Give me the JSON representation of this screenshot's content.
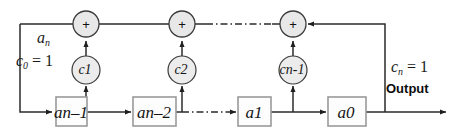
{
  "diagram": {
    "colors": {
      "line": "#2b2b2b",
      "node_fill": "#e8e8e8",
      "box_fill": "#fdfdfd",
      "box_stroke": "#9a9a9a",
      "text": "#151515",
      "background": "#ffffff"
    },
    "adders": [
      {
        "id": "adder-1",
        "symbol": "+",
        "cx": 86,
        "cy": 24
      },
      {
        "id": "adder-2",
        "symbol": "+",
        "cx": 182,
        "cy": 24
      },
      {
        "id": "adder-3",
        "symbol": "+",
        "cx": 293,
        "cy": 24
      }
    ],
    "coefficients": [
      {
        "id": "coef-c1",
        "base": "c",
        "sub": "1",
        "cx": 86,
        "cy": 70
      },
      {
        "id": "coef-c2",
        "base": "c",
        "sub": "2",
        "cx": 182,
        "cy": 70
      },
      {
        "id": "coef-cn1",
        "base": "c",
        "sub": "n-1",
        "cx": 293,
        "cy": 70
      }
    ],
    "delay_boxes": [
      {
        "id": "box-an1",
        "base": "a",
        "sub": "n–1",
        "cx": 62,
        "cy": 112
      },
      {
        "id": "box-an2",
        "base": "a",
        "sub": "n–2",
        "cx": 152,
        "cy": 112
      },
      {
        "id": "box-a1",
        "base": "a",
        "sub": "1",
        "cx": 253,
        "cy": 112
      },
      {
        "id": "box-a0",
        "base": "a",
        "sub": "0",
        "cx": 345,
        "cy": 112
      }
    ],
    "annotations": {
      "input_gain": {
        "base": "a",
        "sub": "n"
      },
      "c0": {
        "base": "c",
        "sub": "0",
        "equals": " = 1"
      },
      "cn": {
        "base": "c",
        "sub": "n",
        "equals": " = 1"
      },
      "output": "Output"
    },
    "ellipses": [
      {
        "id": "ellipsis-top",
        "style": "dash-dot",
        "y": 24,
        "x1": 206,
        "x2": 272
      },
      {
        "id": "ellipsis-bottom",
        "style": "dash-dot",
        "y": 112,
        "x1": 182,
        "x2": 228
      }
    ]
  }
}
